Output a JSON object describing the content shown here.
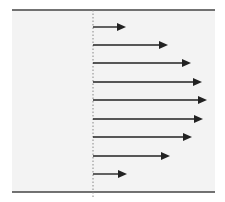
{
  "diagram": {
    "type": "velocity-profile",
    "colors": {
      "background": "#ffffff",
      "fluid_region": "#f3f3f3",
      "wall": "#444444",
      "centerline": "#888888",
      "arrow": "#222222"
    },
    "walls": {
      "top": {
        "x1": 12,
        "x2": 215,
        "y": 10
      },
      "bottom": {
        "x1": 12,
        "x2": 215,
        "y": 192
      }
    },
    "reference_line": {
      "x": 93,
      "y1": 10,
      "y2": 198,
      "style": "dotted"
    },
    "arrows": [
      {
        "y": 27,
        "x_start": 93,
        "x_tip": 126
      },
      {
        "y": 45,
        "x_start": 93,
        "x_tip": 168
      },
      {
        "y": 63,
        "x_start": 93,
        "x_tip": 191
      },
      {
        "y": 82,
        "x_start": 93,
        "x_tip": 202
      },
      {
        "y": 100,
        "x_start": 93,
        "x_tip": 207
      },
      {
        "y": 119,
        "x_start": 93,
        "x_tip": 203
      },
      {
        "y": 137,
        "x_start": 93,
        "x_tip": 192
      },
      {
        "y": 156,
        "x_start": 93,
        "x_tip": 170
      },
      {
        "y": 174,
        "x_start": 93,
        "x_tip": 127
      }
    ]
  }
}
